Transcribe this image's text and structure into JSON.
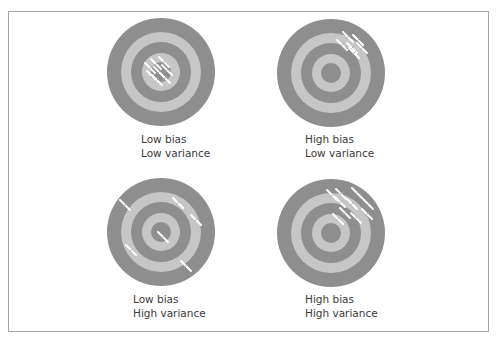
{
  "diagram": {
    "colors": {
      "dark_ring": "#8e8e8e",
      "light_ring": "#c6c6c6",
      "mark": "#ffffff",
      "border": "#a6a6a6"
    },
    "ring_radii": [
      54,
      40,
      30,
      19,
      10
    ],
    "panels": [
      {
        "id": "low-bias-low-variance",
        "center": [
          161,
          72
        ],
        "label": {
          "line1": "Low bias",
          "line2": "Low variance",
          "pos": [
            141,
            132
          ]
        },
        "marks": [
          [
            150,
            68
          ],
          [
            156,
            64
          ],
          [
            164,
            62
          ],
          [
            152,
            76
          ],
          [
            159,
            72
          ],
          [
            167,
            70
          ],
          [
            157,
            80
          ],
          [
            165,
            78
          ]
        ]
      },
      {
        "id": "high-bias-low-variance",
        "center": [
          331,
          73
        ],
        "label": {
          "line1": "High bias",
          "line2": "Low variance",
          "pos": [
            305,
            132
          ]
        },
        "marks": [
          [
            348,
            37
          ],
          [
            358,
            40
          ],
          [
            342,
            45
          ],
          [
            352,
            48
          ],
          [
            362,
            48
          ],
          [
            354,
            53
          ]
        ]
      },
      {
        "id": "low-bias-high-variance",
        "center": [
          161,
          232
        ],
        "label": {
          "line1": "Low bias",
          "line2": "High variance",
          "pos": [
            133,
            292
          ]
        },
        "marks": [
          [
            125,
            205
          ],
          [
            178,
            203
          ],
          [
            196,
            220
          ],
          [
            163,
            237
          ],
          [
            131,
            250
          ],
          [
            186,
            266
          ]
        ]
      },
      {
        "id": "high-bias-high-variance",
        "center": [
          331,
          233
        ],
        "label": {
          "line1": "High bias",
          "line2": "High variance",
          "pos": [
            305,
            292
          ]
        },
        "marks": [
          [
            332,
            195
          ],
          [
            341,
            194
          ],
          [
            357,
            193
          ],
          [
            340,
            202
          ],
          [
            352,
            204
          ],
          [
            368,
            204
          ],
          [
            345,
            213
          ],
          [
            356,
            218
          ],
          [
            367,
            214
          ],
          [
            338,
            219
          ]
        ]
      }
    ]
  }
}
